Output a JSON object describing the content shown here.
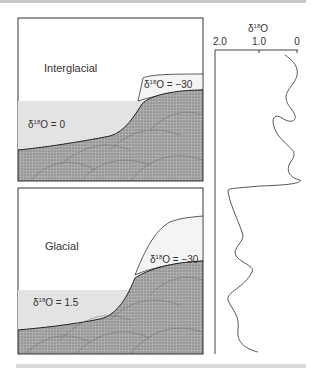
{
  "panels": {
    "top": {
      "title": "Interglacial",
      "ocean_label": "δ18O = 0",
      "ocean_value": "0",
      "ice_label": "δ18O = −30",
      "ice_value": "−30"
    },
    "bottom": {
      "title": "Glacial",
      "ocean_label": "δ18O = 1.5",
      "ocean_value": "1.5",
      "ice_label": "δ18O = −30",
      "ice_value": "−30"
    }
  },
  "record": {
    "axis_title": "δ18O",
    "ticks": [
      "2.0",
      "1.0",
      "0"
    ],
    "axis_reversed": true
  },
  "colors": {
    "ocean": "#e3e3e3",
    "ice": "#f2f2f2",
    "land": "#9a9a9a",
    "line": "#444444"
  }
}
